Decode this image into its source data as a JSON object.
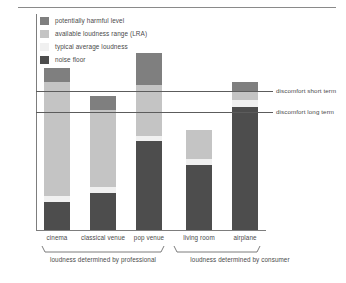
{
  "chart_data": {
    "type": "bar",
    "title": "",
    "subtitle": "",
    "xlabel": "",
    "ylabel": "sound pressure level (dB)",
    "grid": false,
    "legend_position": "top-left",
    "stacked": true,
    "axis_note": "y axis unlabeled (qualitative dB scale, arrow indicates increasing level)",
    "categories": [
      "cinema",
      "classical venue",
      "pop venue",
      "living room",
      "airplane"
    ],
    "series": [
      {
        "name": "noise floor",
        "color": "#4d4d4d",
        "values": [
          18,
          24,
          58,
          42,
          80
        ]
      },
      {
        "name": "typical average loudness",
        "color": "#f0f0f0",
        "values": [
          4,
          4,
          3,
          4,
          4
        ]
      },
      {
        "name": "available loudness range (LRA)",
        "color": "#c4c4c4",
        "values": [
          74,
          50,
          33,
          19,
          6
        ]
      },
      {
        "name": "potentially harmful level",
        "color": "#7f7f7f",
        "values": [
          9,
          9,
          21,
          0,
          6
        ]
      }
    ],
    "annotations": [
      {
        "name": "discomfort short term",
        "type": "hline",
        "y": 105
      },
      {
        "name": "discomfort long term",
        "type": "hline",
        "y": 86
      }
    ],
    "groups": [
      {
        "label": "loudness determined by professional",
        "categories": [
          "cinema",
          "classical venue",
          "pop venue"
        ]
      },
      {
        "label": "loudness determined by consumer",
        "categories": [
          "living room",
          "airplane"
        ]
      }
    ]
  },
  "legend": {
    "items": [
      {
        "label": "potentially harmful level",
        "color": "#7f7f7f"
      },
      {
        "label": "available loudness range (LRA)",
        "color": "#c4c4c4"
      },
      {
        "label": "typical average loudness",
        "color": "#f0f0f0"
      },
      {
        "label": "noise floor",
        "color": "#4d4d4d"
      }
    ]
  },
  "axes": {
    "y_title": "sound pressure level (dB)"
  },
  "annotations": {
    "short_term": "discomfort short term",
    "long_term": "discomfort long term"
  },
  "categories": [
    {
      "label": "cinema"
    },
    {
      "label": "classical venue"
    },
    {
      "label": "pop venue"
    },
    {
      "label": "living room"
    },
    {
      "label": "airplane"
    }
  ],
  "groups": [
    {
      "label": "loudness determined by professional"
    },
    {
      "label": "loudness determined by consumer"
    }
  ],
  "colors": {
    "harmful": "#7f7f7f",
    "lra": "#c4c4c4",
    "average": "#f0f0f0",
    "noise_floor": "#4d4d4d",
    "line": "#5c5c5c",
    "axis": "#7d7d7d",
    "text": "#4a4a4a",
    "background": "#ffffff"
  }
}
